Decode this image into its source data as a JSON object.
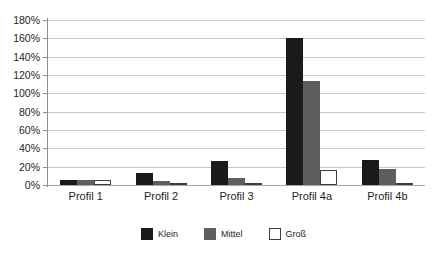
{
  "chart_data": {
    "type": "bar",
    "title": "",
    "subtitle": "",
    "xlabel": "",
    "ylabel": "",
    "categories": [
      "Profil 1",
      "Profil 2",
      "Profil 3",
      "Profil 4a",
      "Profil 4b"
    ],
    "series": [
      {
        "name": "Klein",
        "color": "#1a1a1a",
        "values": [
          5,
          13,
          26,
          160,
          27
        ]
      },
      {
        "name": "Mittel",
        "color": "#5e5e5e",
        "values": [
          5,
          4,
          8,
          113,
          18
        ]
      },
      {
        "name": "Groß",
        "color": "#ffffff",
        "values": [
          5,
          2,
          2,
          16,
          2
        ]
      }
    ],
    "ylim": [
      0,
      180
    ],
    "ytick_step": 20,
    "ytick_labels": [
      "180%",
      "160%",
      "140%",
      "120%",
      "100%",
      "80%",
      "60%",
      "40%",
      "20%",
      "0%"
    ],
    "ytick_values": [
      180,
      160,
      140,
      120,
      100,
      80,
      60,
      40,
      20,
      0
    ],
    "value_suffix": "%",
    "grid": true,
    "grid_color": "#c9c9c9",
    "legend_position": "bottom",
    "background": "#ffffff"
  },
  "axis": {
    "y_labels": [
      "180%",
      "160%",
      "140%",
      "120%",
      "100%",
      "80%",
      "60%",
      "40%",
      "20%",
      "0%"
    ],
    "x_labels": [
      "Profil 1",
      "Profil 2",
      "Profil 3",
      "Profil 4a",
      "Profil 4b"
    ]
  },
  "legend": {
    "items": [
      {
        "label": "Klein"
      },
      {
        "label": "Mittel"
      },
      {
        "label": "Groß"
      }
    ]
  }
}
